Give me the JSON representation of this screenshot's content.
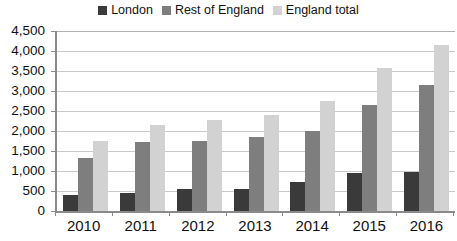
{
  "legend": {
    "position": "top-center",
    "items": [
      {
        "label": "London",
        "color": "#3a3a3a",
        "key": "london"
      },
      {
        "label": "Rest of England",
        "color": "#7e7e7e",
        "key": "rest"
      },
      {
        "label": "England total",
        "color": "#d2d2d2",
        "key": "total"
      }
    ]
  },
  "axes": {
    "y_ticks": [
      "4,500",
      "4,000",
      "3,500",
      "3,000",
      "2,500",
      "2,000",
      "1,500",
      "1,000",
      "500",
      "0"
    ],
    "x_ticks": [
      "2010",
      "2011",
      "2012",
      "2013",
      "2014",
      "2015",
      "2016"
    ]
  },
  "chart_data": {
    "type": "bar",
    "title": "",
    "subtitle": "",
    "xlabel": "",
    "ylabel": "",
    "ylim": [
      0,
      4500
    ],
    "ytick_step": 500,
    "grid": true,
    "legend_position": "top-center",
    "categories": [
      "2010",
      "2011",
      "2012",
      "2013",
      "2014",
      "2015",
      "2016"
    ],
    "series": [
      {
        "name": "London",
        "color": "#3a3a3a",
        "values": [
          390,
          450,
          550,
          560,
          730,
          960,
          970
        ]
      },
      {
        "name": "Rest of England",
        "color": "#7e7e7e",
        "values": [
          1330,
          1720,
          1740,
          1850,
          2000,
          2640,
          3160
        ]
      },
      {
        "name": "England total",
        "color": "#d2d2d2",
        "values": [
          1750,
          2150,
          2280,
          2400,
          2740,
          3570,
          4140
        ]
      }
    ]
  }
}
